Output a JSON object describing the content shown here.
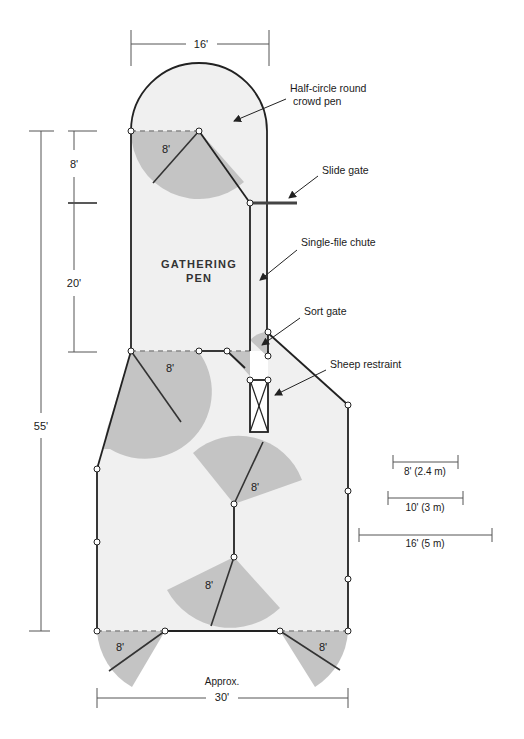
{
  "colors": {
    "pen_fill": "#f0f0f0",
    "swing_fill": "#c4c4c4",
    "wall": "#222222",
    "dim_line": "#555555",
    "node_fill": "#ffffff"
  },
  "labels": {
    "gathering_pen_line1": "GATHERING",
    "gathering_pen_line2": "PEN",
    "crowd_pen_line1": "Half-circle round",
    "crowd_pen_line2": "crowd pen",
    "slide_gate": "Slide gate",
    "single_file_chute": "Single-file chute",
    "sort_gate": "Sort gate",
    "sheep_restraint": "Sheep restraint"
  },
  "dimensions": {
    "top_width": "16'",
    "crowd_pen_depth": "8'",
    "gathering_pen_length": "20'",
    "total_length": "55'",
    "bottom_width_line1": "Approx.",
    "bottom_width_line2": "30'"
  },
  "gate_swings": [
    {
      "id": "crowd-pen-gate",
      "label": "8'"
    },
    {
      "id": "gathering-exit-gate",
      "label": "8'"
    },
    {
      "id": "center-upper-gate",
      "label": "8'"
    },
    {
      "id": "center-lower-gate",
      "label": "8'"
    },
    {
      "id": "bottom-left-gate",
      "label": "8'"
    },
    {
      "id": "bottom-right-gate",
      "label": "8'"
    }
  ],
  "scale_bars": [
    {
      "label": "8' (2.4 m)"
    },
    {
      "label": "10' (3 m)"
    },
    {
      "label": "16' (5 m)"
    }
  ]
}
